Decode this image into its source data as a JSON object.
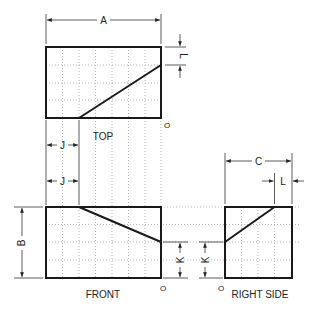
{
  "views": {
    "top": {
      "label": "TOP",
      "origin": "O"
    },
    "front": {
      "label": "FRONT",
      "origin": "O"
    },
    "right_side": {
      "label": "RIGHT SIDE",
      "origin": "O"
    }
  },
  "dimensions": {
    "a": "A",
    "b": "B",
    "c": "C",
    "j_top": "J",
    "j_front": "J",
    "k_front": "K",
    "k_side": "K",
    "l_top": "L",
    "l_side": "L"
  },
  "colors": {
    "outline": "#1a1a1a",
    "grid": "#9a9a9a",
    "dim": "#333333"
  }
}
